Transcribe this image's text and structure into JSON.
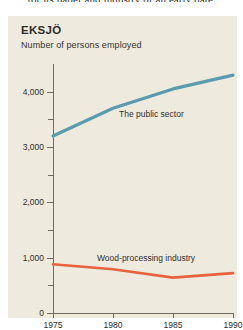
{
  "caption": "for its paper and industry of an early date.",
  "figure": {
    "title": "EKSJÖ",
    "subtitle": "Number of persons employed"
  },
  "colors": {
    "panel_background": "#efeade",
    "page_background": "#ffffff",
    "axis": "#6f6a62",
    "text": "#2f2d29",
    "public_sector": "#5a9bb0",
    "wood_industry": "#e8633c"
  },
  "chart_data": {
    "type": "line",
    "title": "EKSJÖ",
    "subtitle": "Number of persons employed",
    "xlabel": "",
    "ylabel": "Number of persons employed",
    "x": [
      1975,
      1980,
      1985,
      1990
    ],
    "xlim": [
      1975,
      1990
    ],
    "ylim": [
      0,
      4500
    ],
    "xticks": [
      "1975",
      "1980",
      "1985",
      "1990"
    ],
    "yticks": [
      "0",
      "1,000",
      "2,000",
      "3,000",
      "4,000"
    ],
    "ytick_values": [
      0,
      1000,
      2000,
      3000,
      4000
    ],
    "yminor_values": [
      500,
      1500,
      2500,
      3500
    ],
    "grid": false,
    "legend": "inline-labels",
    "series": [
      {
        "name": "The public sector",
        "color": "#5a9bb0",
        "x": [
          1975,
          1980,
          1985,
          1990
        ],
        "values": [
          3200,
          3700,
          4050,
          4300
        ]
      },
      {
        "name": "Wood-processing industry",
        "color": "#e8633c",
        "x": [
          1975,
          1980,
          1985,
          1990
        ],
        "values": [
          880,
          790,
          640,
          720
        ]
      }
    ]
  },
  "labels": {
    "public_sector": "The public sector",
    "wood_industry": "Wood-processing industry"
  }
}
